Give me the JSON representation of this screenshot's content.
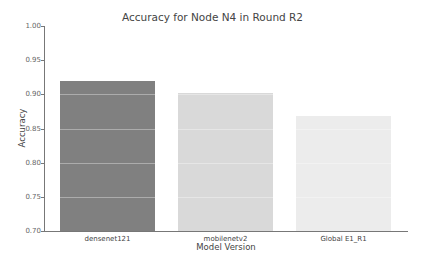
{
  "chart_data": {
    "type": "bar",
    "title": "Accuracy for Node N4 in Round R2",
    "xlabel": "Model Version",
    "ylabel": "Accuracy",
    "categories": [
      "densenet121",
      "mobilenetv2",
      "Global E1_R1"
    ],
    "values": [
      0.92,
      0.902,
      0.868
    ],
    "colors": [
      "#808080",
      "#d9d9d9",
      "#ececec"
    ],
    "ylim": [
      0.7,
      1.0
    ],
    "yticks": [
      "1.00",
      "0.95",
      "0.90",
      "0.85",
      "0.80",
      "0.75",
      "0.70"
    ],
    "grid": true,
    "legend": null
  }
}
